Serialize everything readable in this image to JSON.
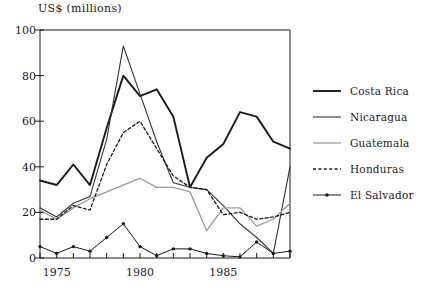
{
  "chart_data": {
    "type": "line",
    "title": "",
    "ylabel": "US$ (millions)",
    "xlabel": "",
    "ylim": [
      0,
      100
    ],
    "xlim": [
      1974,
      1989
    ],
    "yticks": [
      0,
      20,
      40,
      60,
      80,
      100
    ],
    "xticks": [
      1974,
      1975,
      1976,
      1977,
      1978,
      1979,
      1980,
      1981,
      1982,
      1983,
      1984,
      1985,
      1986,
      1987,
      1988,
      1989
    ],
    "xtick_labels_shown": [
      "1975",
      "1980",
      "1985"
    ],
    "xtick_labels_shown_values": [
      1975,
      1980,
      1985
    ],
    "grid": false,
    "legend_position": "right",
    "x": [
      1974,
      1975,
      1976,
      1977,
      1978,
      1979,
      1980,
      1981,
      1982,
      1983,
      1984,
      1985,
      1986,
      1987,
      1988,
      1989
    ],
    "series": [
      {
        "name": "Costa Rica",
        "style": "solid",
        "color": "#1a1a1a",
        "width": 1.9,
        "marker": "none",
        "values": [
          34,
          32,
          41,
          32,
          57,
          80,
          71,
          74,
          62,
          31,
          44,
          50,
          64,
          62,
          51,
          48
        ]
      },
      {
        "name": "Nicaragua",
        "style": "solid",
        "color": "#333333",
        "width": 1.1,
        "marker": "none",
        "values": [
          22,
          18,
          24,
          27,
          52,
          93,
          72,
          51,
          33,
          31,
          30,
          23,
          15,
          9,
          2,
          40
        ]
      },
      {
        "name": "Guatemala",
        "style": "solid",
        "color": "#9a9a9a",
        "width": 1.3,
        "marker": "none",
        "values": [
          21,
          17,
          22,
          26,
          29,
          32,
          35,
          31,
          31,
          29,
          12,
          22,
          22,
          14,
          17,
          24
        ]
      },
      {
        "name": "Honduras",
        "style": "dotted",
        "color": "#1a1a1a",
        "width": 1.3,
        "marker": "none",
        "values": [
          17,
          17,
          23,
          21,
          41,
          55,
          60,
          48,
          36,
          31,
          30,
          19,
          20,
          17,
          18,
          20
        ]
      },
      {
        "name": "El Salvador",
        "style": "solid",
        "color": "#1a1a1a",
        "width": 1.0,
        "marker": "dot",
        "values": [
          5,
          2,
          5,
          3,
          9,
          15,
          5,
          1,
          4,
          4,
          2,
          1,
          0.5,
          7,
          2,
          3
        ]
      }
    ]
  },
  "axes": {
    "y_title": "US$ (millions)"
  },
  "legend": {
    "items": [
      {
        "label": "Costa Rica"
      },
      {
        "label": "Nicaragua"
      },
      {
        "label": "Guatemala"
      },
      {
        "label": "Honduras"
      },
      {
        "label": "El Salvador"
      }
    ]
  }
}
